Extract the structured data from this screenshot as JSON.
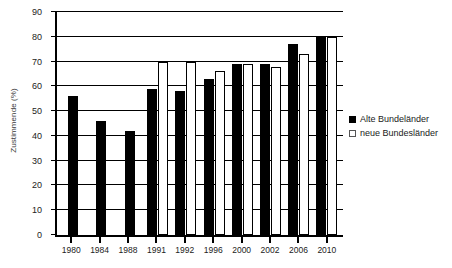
{
  "chart_data": {
    "type": "bar",
    "title": "",
    "xlabel": "",
    "ylabel": "Zustimmende (%)",
    "categories": [
      "1980",
      "1984",
      "1988",
      "1991",
      "1992",
      "1996",
      "2000",
      "2002",
      "2006",
      "2010"
    ],
    "series": [
      {
        "name": "Alte Bundeländer",
        "color": "#000000",
        "style": "filled",
        "values": [
          56,
          46,
          42,
          59,
          58,
          63,
          69,
          69,
          77,
          80
        ]
      },
      {
        "name": "neue Bundesländer",
        "color": "#ffffff",
        "style": "hollow",
        "values": [
          null,
          null,
          null,
          70,
          70,
          66,
          69,
          68,
          73,
          80
        ]
      }
    ],
    "ylim": [
      0,
      90
    ],
    "ytick_values": [
      0,
      10,
      20,
      30,
      40,
      50,
      60,
      70,
      80,
      90
    ],
    "ytick_labels": [
      "0",
      "10",
      "20",
      "30",
      "40",
      "50",
      "60",
      "70",
      "80",
      "90"
    ],
    "grid": true,
    "grid_axis": "y",
    "legend_position": "right"
  },
  "legend": {
    "items": [
      {
        "label": "Alte Bundeländer",
        "marker": "filled-square-icon"
      },
      {
        "label": "neue Bundesländer",
        "marker": "hollow-square-icon"
      }
    ]
  }
}
